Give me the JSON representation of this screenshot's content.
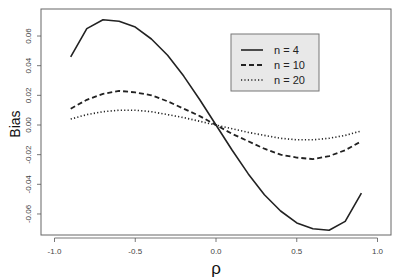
{
  "chart_data": {
    "type": "line",
    "title": "",
    "xlabel": "ρ",
    "ylabel": "Bias",
    "xlim": [
      -1.0,
      1.0
    ],
    "ylim": [
      -0.075,
      0.077
    ],
    "x_ticks": [
      -1.0,
      -0.5,
      0.0,
      0.5,
      1.0
    ],
    "x_tick_labels": [
      "-1.0",
      "-0.5",
      "0.0",
      "0.5",
      "1.0"
    ],
    "y_ticks": [
      -0.06,
      -0.04,
      -0.02,
      0.0,
      0.02,
      0.04,
      0.06
    ],
    "y_tick_labels": [
      "-0.06",
      "-0.04",
      "-0.02",
      "0.00",
      "0.02",
      "0.04",
      "0.06"
    ],
    "grid": false,
    "legend_position": "top-right (inside)",
    "x": [
      -0.9,
      -0.8,
      -0.7,
      -0.6,
      -0.5,
      -0.4,
      -0.3,
      -0.2,
      -0.1,
      0.0,
      0.1,
      0.2,
      0.3,
      0.4,
      0.5,
      0.6,
      0.7,
      0.8,
      0.9
    ],
    "series": [
      {
        "name": "n = 4",
        "style": "solid",
        "values": [
          0.046,
          0.065,
          0.071,
          0.07,
          0.066,
          0.058,
          0.047,
          0.033,
          0.017,
          0.0,
          -0.017,
          -0.033,
          -0.047,
          -0.058,
          -0.066,
          -0.07,
          -0.071,
          -0.065,
          -0.046
        ]
      },
      {
        "name": "n = 10",
        "style": "dashed",
        "values": [
          0.011,
          0.017,
          0.021,
          0.023,
          0.022,
          0.02,
          0.016,
          0.011,
          0.006,
          0.0,
          -0.006,
          -0.011,
          -0.016,
          -0.02,
          -0.022,
          -0.023,
          -0.021,
          -0.017,
          -0.011
        ]
      },
      {
        "name": "n = 20",
        "style": "dotted",
        "values": [
          0.004,
          0.007,
          0.009,
          0.01,
          0.01,
          0.009,
          0.007,
          0.005,
          0.0025,
          0.0,
          -0.0025,
          -0.005,
          -0.007,
          -0.009,
          -0.01,
          -0.01,
          -0.009,
          -0.007,
          -0.004
        ]
      }
    ]
  },
  "colors": {
    "line": "#222222",
    "axis": "#555555",
    "legend_bg": "#e8e8e8",
    "legend_border": "#777777"
  }
}
